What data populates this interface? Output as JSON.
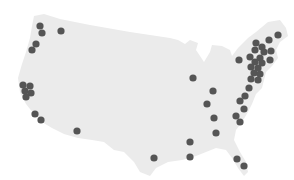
{
  "map": {
    "region": "United States (contiguous)",
    "land_color": "#ebebeb",
    "background_color": "#ffffff",
    "marker_color": "#555555",
    "marker_radius": 3.6,
    "markers": [
      {
        "x": 40,
        "y": 26
      },
      {
        "x": 42,
        "y": 33
      },
      {
        "x": 61,
        "y": 31
      },
      {
        "x": 36,
        "y": 44
      },
      {
        "x": 32,
        "y": 50
      },
      {
        "x": 23,
        "y": 85
      },
      {
        "x": 30,
        "y": 86
      },
      {
        "x": 25,
        "y": 91
      },
      {
        "x": 31,
        "y": 93
      },
      {
        "x": 26,
        "y": 97
      },
      {
        "x": 35,
        "y": 114
      },
      {
        "x": 41,
        "y": 120
      },
      {
        "x": 77,
        "y": 131
      },
      {
        "x": 193,
        "y": 78
      },
      {
        "x": 213,
        "y": 91
      },
      {
        "x": 207,
        "y": 104
      },
      {
        "x": 214,
        "y": 118
      },
      {
        "x": 216,
        "y": 133
      },
      {
        "x": 190,
        "y": 142
      },
      {
        "x": 190,
        "y": 157
      },
      {
        "x": 154,
        "y": 158
      },
      {
        "x": 278,
        "y": 35
      },
      {
        "x": 269,
        "y": 40
      },
      {
        "x": 256,
        "y": 43
      },
      {
        "x": 262,
        "y": 47
      },
      {
        "x": 255,
        "y": 50
      },
      {
        "x": 264,
        "y": 52
      },
      {
        "x": 271,
        "y": 51
      },
      {
        "x": 239,
        "y": 60
      },
      {
        "x": 250,
        "y": 57
      },
      {
        "x": 260,
        "y": 58
      },
      {
        "x": 255,
        "y": 62
      },
      {
        "x": 262,
        "y": 63
      },
      {
        "x": 270,
        "y": 60
      },
      {
        "x": 251,
        "y": 67
      },
      {
        "x": 258,
        "y": 68
      },
      {
        "x": 254,
        "y": 73
      },
      {
        "x": 260,
        "y": 74
      },
      {
        "x": 251,
        "y": 79
      },
      {
        "x": 258,
        "y": 80
      },
      {
        "x": 249,
        "y": 88
      },
      {
        "x": 245,
        "y": 96
      },
      {
        "x": 240,
        "y": 101
      },
      {
        "x": 244,
        "y": 109
      },
      {
        "x": 236,
        "y": 116
      },
      {
        "x": 240,
        "y": 122
      },
      {
        "x": 237,
        "y": 159
      },
      {
        "x": 244,
        "y": 166
      }
    ]
  }
}
